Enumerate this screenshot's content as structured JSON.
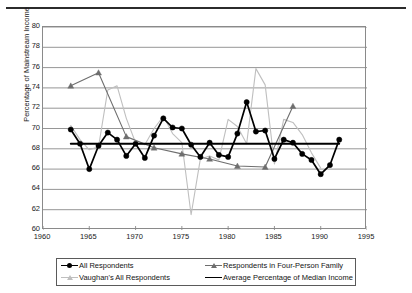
{
  "chart_data": {
    "type": "line",
    "title": "",
    "xlabel": "",
    "ylabel": "Percentage of Mainstream Income",
    "xlim": [
      1960,
      1995
    ],
    "ylim": [
      60,
      80
    ],
    "xticks": [
      1960,
      1965,
      1970,
      1975,
      1980,
      1985,
      1990,
      1995
    ],
    "yticks": [
      60,
      62,
      64,
      66,
      68,
      70,
      72,
      74,
      76,
      78,
      80
    ],
    "grid": "horizontal",
    "legend_position": "bottom",
    "series": [
      {
        "name": "All Respondents",
        "color": "#000000",
        "marker": "circle",
        "x": [
          1963,
          1964,
          1965,
          1966,
          1967,
          1968,
          1969,
          1970,
          1971,
          1972,
          1973,
          1974,
          1975,
          1976,
          1977,
          1978,
          1979,
          1980,
          1981,
          1982,
          1983,
          1984,
          1985,
          1986,
          1987,
          1988,
          1989,
          1990,
          1991,
          1992
        ],
        "y": [
          69.9,
          68.5,
          66.0,
          68.3,
          69.6,
          68.9,
          67.3,
          68.5,
          67.1,
          69.3,
          71.0,
          70.1,
          70.0,
          68.4,
          67.2,
          68.6,
          67.4,
          67.2,
          69.5,
          72.6,
          69.7,
          69.8,
          67.0,
          68.9,
          68.6,
          67.5,
          66.9,
          65.5,
          66.4,
          68.9
        ]
      },
      {
        "name": "Respondents in Four-Person Family",
        "color": "#6e6e6e",
        "marker": "triangle",
        "x": [
          1963,
          1966,
          1969,
          1972,
          1975,
          1978,
          1981,
          1984,
          1987
        ],
        "y": [
          74.2,
          75.5,
          69.2,
          68.1,
          67.5,
          67.0,
          66.3,
          66.2,
          72.2
        ]
      },
      {
        "name": "Vaughan's All Respondents",
        "color": "#bfbfbf",
        "marker": "none",
        "x": [
          1963,
          1964,
          1965,
          1966,
          1967,
          1968,
          1969,
          1970,
          1971,
          1972,
          1973,
          1974,
          1975,
          1976,
          1977,
          1978,
          1979,
          1980,
          1981,
          1982,
          1983,
          1984,
          1985,
          1986,
          1987,
          1988,
          1989,
          1990
        ],
        "y": [
          70.3,
          68.9,
          67.9,
          68.2,
          73.8,
          74.2,
          71.0,
          68.6,
          68.4,
          70.0,
          71.2,
          69.5,
          68.6,
          61.5,
          67.0,
          67.3,
          66.9,
          70.9,
          70.2,
          68.5,
          75.9,
          74.3,
          66.5,
          70.9,
          70.6,
          69.4,
          67.6,
          66.1
        ]
      },
      {
        "name": "Average Percentage of Median Income",
        "color": "#000000",
        "marker": "none",
        "x": [
          1963,
          1992
        ],
        "y": [
          68.5,
          68.5
        ]
      }
    ]
  },
  "axes": {
    "y_title": "Percentage of Mainstream Income",
    "y_tick_labels": [
      "80",
      "78",
      "76",
      "74",
      "72",
      "70",
      "68",
      "66",
      "64",
      "62",
      "60"
    ],
    "x_tick_labels": [
      "1960",
      "1965",
      "1970",
      "1975",
      "1980",
      "1985",
      "1990",
      "1995"
    ]
  },
  "legend": {
    "entries": [
      {
        "label": "All Respondents",
        "color": "#000000",
        "marker": "circle"
      },
      {
        "label": "Respondents in Four-Person Family",
        "color": "#6e6e6e",
        "marker": "triangle"
      },
      {
        "label": "Vaughan's All Respondents",
        "color": "#bfbfbf",
        "marker": "triangle"
      },
      {
        "label": "Average Percentage of Median Income",
        "color": "#000000",
        "marker": "none"
      }
    ]
  }
}
